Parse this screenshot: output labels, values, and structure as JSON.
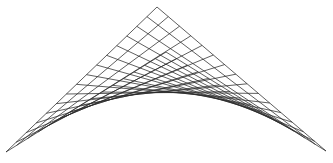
{
  "diagram": {
    "title": "Hyperbolic paraboloid wireframe (ruled saddle surface)",
    "type": "ruled-surface-wireframe",
    "line_color": "#2a2a2a",
    "background": "#ffffff",
    "divisions": 15,
    "corners": {
      "apex": [
        157,
        7
      ],
      "left": [
        6,
        152
      ],
      "right": [
        326,
        151
      ],
      "back": [
        166,
        52
      ]
    },
    "lower_envelope_peak": [
      160,
      100
    ]
  }
}
